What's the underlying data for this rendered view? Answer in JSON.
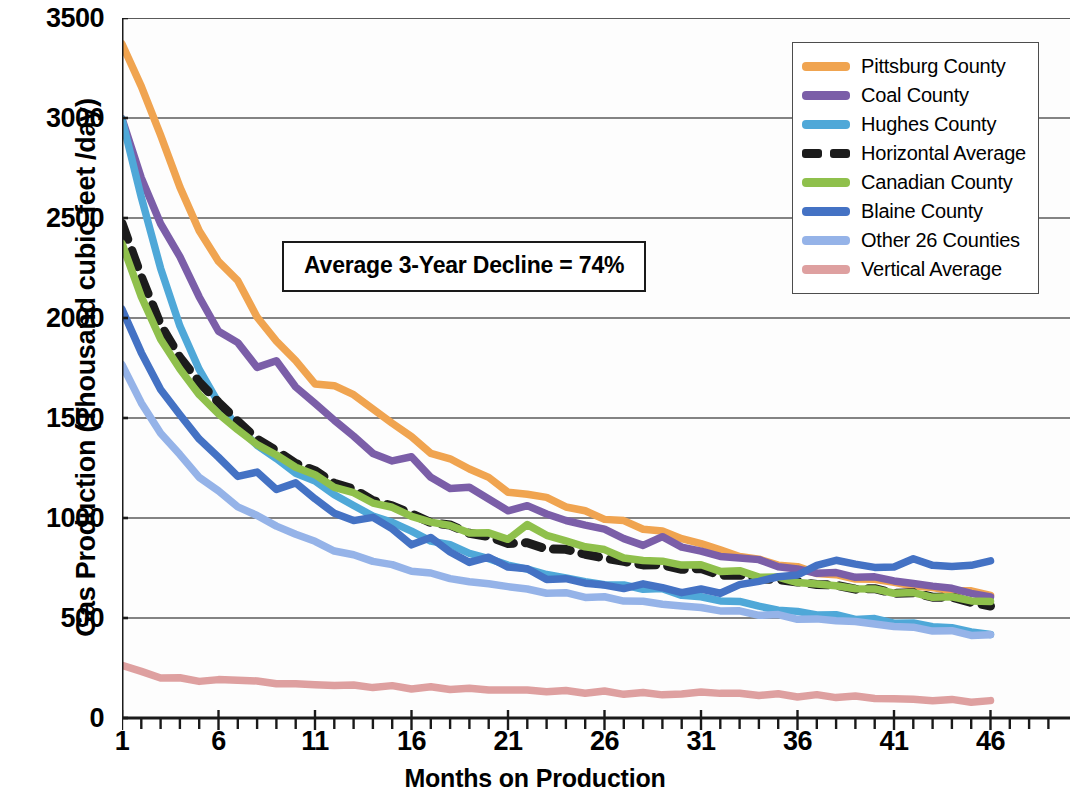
{
  "chart_data": {
    "type": "line",
    "title": "",
    "xlabel": "Months on Production",
    "ylabel": "Gas Production (Thousand cubic feet /day)",
    "xlim": [
      1,
      46
    ],
    "ylim": [
      0,
      3500
    ],
    "ytick_labels": [
      "0",
      "500",
      "1000",
      "1500",
      "2000",
      "2500",
      "3000",
      "3500"
    ],
    "yticks": [
      0,
      500,
      1000,
      1500,
      2000,
      2500,
      3000,
      3500
    ],
    "xtick_labels": [
      "1",
      "6",
      "11",
      "16",
      "21",
      "26",
      "31",
      "36",
      "41",
      "46"
    ],
    "xticks": [
      1,
      6,
      11,
      16,
      21,
      26,
      31,
      36,
      41,
      46
    ],
    "minor_xticks_every": 1,
    "grid": "horizontal",
    "legend_position": "top-right",
    "annotation": "Average 3-Year Decline = 74%",
    "x": [
      1,
      2,
      3,
      4,
      5,
      6,
      7,
      8,
      9,
      10,
      11,
      12,
      13,
      14,
      15,
      16,
      17,
      18,
      19,
      20,
      21,
      22,
      23,
      24,
      25,
      26,
      27,
      28,
      29,
      30,
      31,
      32,
      33,
      34,
      35,
      36,
      37,
      38,
      39,
      40,
      41,
      42,
      43,
      44,
      45,
      46
    ],
    "series": [
      {
        "name": "Pittsburg County",
        "color": "#F0A450",
        "dashed": false,
        "values": [
          3370,
          3160,
          2910,
          2660,
          2430,
          2290,
          2180,
          2010,
          1880,
          1790,
          1670,
          1660,
          1620,
          1540,
          1480,
          1400,
          1330,
          1290,
          1250,
          1200,
          1130,
          1120,
          1100,
          1060,
          1030,
          1000,
          980,
          950,
          930,
          900,
          870,
          840,
          810,
          790,
          770,
          750,
          730,
          710,
          700,
          690,
          680,
          660,
          650,
          640,
          630,
          620
        ]
      },
      {
        "name": "Coal County",
        "color": "#7B5EA8",
        "dashed": false,
        "values": [
          3000,
          2700,
          2470,
          2310,
          2100,
          1940,
          1870,
          1760,
          1780,
          1660,
          1570,
          1490,
          1410,
          1320,
          1290,
          1300,
          1210,
          1140,
          1160,
          1090,
          1040,
          1060,
          1020,
          990,
          960,
          950,
          890,
          870,
          900,
          860,
          830,
          810,
          800,
          790,
          760,
          740,
          730,
          720,
          710,
          700,
          690,
          670,
          660,
          650,
          620,
          610
        ]
      },
      {
        "name": "Hughes County",
        "color": "#4FA8D8",
        "dashed": false,
        "values": [
          3000,
          2600,
          2250,
          1960,
          1740,
          1580,
          1450,
          1370,
          1290,
          1230,
          1180,
          1120,
          1060,
          1010,
          980,
          930,
          890,
          860,
          830,
          790,
          770,
          740,
          720,
          700,
          680,
          670,
          660,
          650,
          640,
          620,
          600,
          590,
          580,
          560,
          540,
          530,
          520,
          510,
          500,
          490,
          480,
          470,
          460,
          450,
          430,
          420
        ]
      },
      {
        "name": "Horizontal Average",
        "color": "#1C1C1C",
        "dashed": true,
        "values": [
          2480,
          2200,
          1970,
          1800,
          1680,
          1580,
          1480,
          1400,
          1330,
          1280,
          1230,
          1180,
          1140,
          1090,
          1060,
          1020,
          980,
          960,
          930,
          900,
          880,
          870,
          850,
          840,
          820,
          800,
          780,
          770,
          760,
          750,
          740,
          720,
          710,
          700,
          690,
          680,
          670,
          660,
          650,
          640,
          630,
          620,
          610,
          600,
          580,
          560
        ]
      },
      {
        "name": "Canadian County",
        "color": "#8FC04C",
        "dashed": false,
        "values": [
          2380,
          2100,
          1900,
          1740,
          1620,
          1520,
          1440,
          1370,
          1310,
          1260,
          1210,
          1160,
          1120,
          1080,
          1050,
          1010,
          980,
          960,
          930,
          920,
          900,
          960,
          920,
          880,
          860,
          840,
          800,
          790,
          780,
          770,
          760,
          740,
          730,
          710,
          700,
          680,
          670,
          660,
          650,
          640,
          630,
          620,
          610,
          600,
          590,
          580
        ]
      },
      {
        "name": "Blaine County",
        "color": "#4472C4",
        "dashed": false,
        "values": [
          2050,
          1820,
          1650,
          1510,
          1400,
          1300,
          1210,
          1230,
          1140,
          1180,
          1090,
          1030,
          980,
          1010,
          940,
          870,
          900,
          830,
          780,
          800,
          760,
          740,
          700,
          690,
          680,
          660,
          650,
          670,
          650,
          630,
          640,
          630,
          660,
          690,
          700,
          720,
          760,
          790,
          770,
          750,
          760,
          790,
          770,
          750,
          770,
          780
        ]
      },
      {
        "name": "Other 26 Counties",
        "color": "#95B3E8",
        "dashed": false,
        "values": [
          1770,
          1570,
          1430,
          1310,
          1210,
          1130,
          1060,
          1010,
          960,
          920,
          880,
          840,
          810,
          790,
          760,
          740,
          720,
          700,
          680,
          670,
          660,
          640,
          630,
          620,
          610,
          600,
          590,
          580,
          570,
          560,
          550,
          540,
          530,
          520,
          510,
          500,
          490,
          490,
          480,
          470,
          460,
          450,
          440,
          430,
          420,
          410
        ]
      },
      {
        "name": "Vertical Average",
        "color": "#DEA0A0",
        "dashed": false,
        "values": [
          265,
          230,
          205,
          195,
          190,
          185,
          195,
          180,
          175,
          170,
          165,
          165,
          160,
          158,
          155,
          152,
          150,
          148,
          145,
          142,
          140,
          138,
          135,
          132,
          130,
          128,
          125,
          122,
          120,
          118,
          130,
          125,
          120,
          118,
          115,
          112,
          110,
          108,
          105,
          100,
          95,
          92,
          90,
          88,
          85,
          80
        ]
      }
    ]
  },
  "legend": {
    "items": [
      {
        "label": "Pittsburg County",
        "color": "#F0A450",
        "dashed": false
      },
      {
        "label": "Coal County",
        "color": "#7B5EA8",
        "dashed": false
      },
      {
        "label": "Hughes County",
        "color": "#4FA8D8",
        "dashed": false
      },
      {
        "label": "Horizontal Average",
        "color": "#1C1C1C",
        "dashed": true
      },
      {
        "label": "Canadian County",
        "color": "#8FC04C",
        "dashed": false
      },
      {
        "label": "Blaine County",
        "color": "#4472C4",
        "dashed": false
      },
      {
        "label": "Other 26 Counties",
        "color": "#95B3E8",
        "dashed": false
      },
      {
        "label": "Vertical Average",
        "color": "#DEA0A0",
        "dashed": false
      }
    ]
  },
  "colors": {
    "axis": "#1a1a1a",
    "gridline": "#5a5a5a",
    "plot_background": "#fdfdfd"
  }
}
